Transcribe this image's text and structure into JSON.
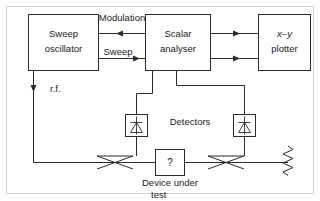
{
  "diagram": {
    "blocks": [
      {
        "id": "sweep_oscillator",
        "line1": "Sweep",
        "line2": "oscillator"
      },
      {
        "id": "scalar_analyser",
        "line1": "Scalar",
        "line2": "analyser"
      },
      {
        "id": "xy_plotter",
        "line1": "x–y",
        "line2": "plotter"
      },
      {
        "id": "device_under_test",
        "symbol": "?",
        "line1": "Device under",
        "line2": "test"
      }
    ],
    "wire_labels": {
      "modulation": "Modulation",
      "sweep": "Sweep",
      "rf": "r.f."
    },
    "annotations": {
      "detectors": "Detectors"
    },
    "symbols": {
      "detector_left": "diode-detector-icon",
      "detector_right": "diode-detector-icon",
      "coupler_left": "directional-coupler-icon",
      "coupler_right": "directional-coupler-icon",
      "termination": "matched-load-resistor-icon"
    },
    "colors": {
      "line": "#2b2b2b",
      "background": "#ffffff",
      "frame": "#d2d2d2",
      "text": "#1a1a1a"
    }
  }
}
